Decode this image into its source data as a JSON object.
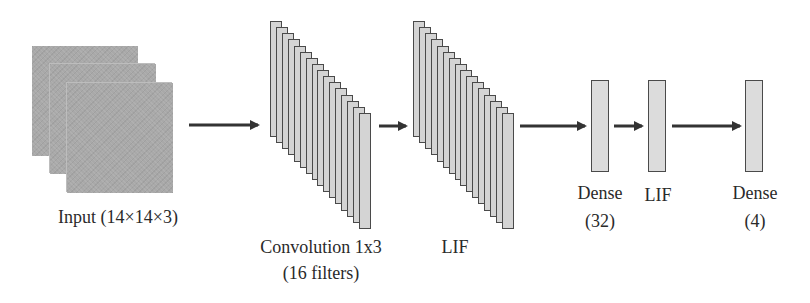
{
  "diagram": {
    "title": "",
    "nodes": [
      {
        "id": "input",
        "label": "Input (14×14×3)",
        "type": "feature-maps",
        "count": 3
      },
      {
        "id": "conv",
        "label_line1": "Convolution 1x3",
        "label_line2": "(16 filters)",
        "type": "slab-stack",
        "count": 16
      },
      {
        "id": "lif1",
        "label": "LIF",
        "type": "slab-stack",
        "count": 16
      },
      {
        "id": "dense1",
        "label_line1": "Dense",
        "label_line2": "(32)",
        "type": "vector"
      },
      {
        "id": "lif2",
        "label": "LIF",
        "type": "vector"
      },
      {
        "id": "dense2",
        "label_line1": "Dense",
        "label_line2": "(4)",
        "type": "vector"
      }
    ],
    "edges": [
      {
        "from": "input",
        "to": "conv"
      },
      {
        "from": "conv",
        "to": "lif1"
      },
      {
        "from": "lif1",
        "to": "dense1"
      },
      {
        "from": "dense1",
        "to": "lif2"
      },
      {
        "from": "lif2",
        "to": "dense2"
      }
    ],
    "colors": {
      "input_fill": "#a9a9a9",
      "slab_fill": "#d4d4d4",
      "border": "#4a4a4a",
      "arrow": "#333333",
      "text": "#2a2a2a"
    }
  }
}
